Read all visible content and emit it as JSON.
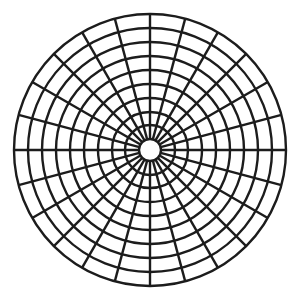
{
  "diagram": {
    "type": "polar-grid",
    "background": "#ffffff",
    "stroke_color": "#1c1c1c",
    "stroke_width": 2.4,
    "center": [
      150,
      150
    ],
    "hub_radius": 11,
    "ring_radii": [
      25,
      38,
      52,
      66,
      80,
      94,
      108,
      122,
      136
    ],
    "spoke_count": 24,
    "spoke_angle_step_deg": 15
  }
}
